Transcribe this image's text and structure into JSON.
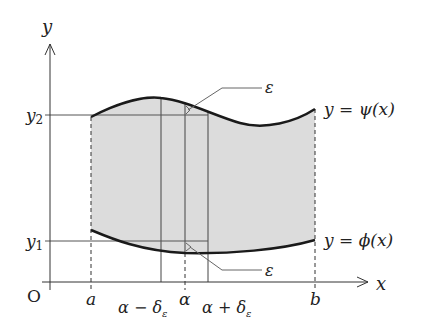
{
  "axes": {
    "x_label": "x",
    "y_label": "y",
    "origin_label": "O"
  },
  "y_ticks": {
    "y2": "y",
    "y2_sub": "2",
    "y1": "y",
    "y1_sub": "1"
  },
  "x_ticks": {
    "a": "a",
    "alpha_minus": "α − δ",
    "alpha_minus_sub": "ε",
    "alpha": "α",
    "alpha_plus": "α + δ",
    "alpha_plus_sub": "ε",
    "b": "b"
  },
  "curves": {
    "upper_label": "y = ψ(x)",
    "lower_label": "y = ϕ(x)"
  },
  "annotations": {
    "epsilon_top": "ε",
    "epsilon_bottom": "ε"
  },
  "colors": {
    "fill": "#dcdcdc",
    "curve": "#1a1a1a",
    "line": "#555555"
  }
}
